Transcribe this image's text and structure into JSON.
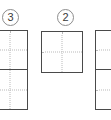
{
  "canvas": {
    "background_color": "#ffffff",
    "width": 111,
    "height": 120
  },
  "style": {
    "panel_border_color": "#4a4a4a",
    "panel_fill_color": "#ffffff",
    "guide_color": "#b9b9b9",
    "badge_border_color": "#8d8d8d",
    "badge_text_color": "#3a3a3a"
  },
  "badges": [
    {
      "label": "3",
      "name": "step-badge-3"
    },
    {
      "label": "2",
      "name": "step-badge-2"
    }
  ],
  "groups": [
    {
      "name": "panel-group-left",
      "panel_count": 2,
      "cropped": "left-edge",
      "panels": [
        {
          "guides": "crosshair"
        },
        {
          "guides": "crosshair"
        }
      ]
    },
    {
      "name": "panel-group-middle",
      "panel_count": 1,
      "cropped": "none",
      "panels": [
        {
          "guides": "crosshair"
        }
      ]
    },
    {
      "name": "panel-group-right",
      "panel_count": 2,
      "cropped": "right-edge",
      "panels": [
        {
          "guides": "crosshair"
        },
        {
          "guides": "crosshair"
        }
      ]
    }
  ]
}
